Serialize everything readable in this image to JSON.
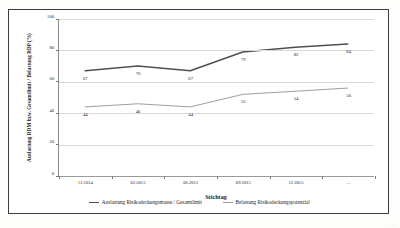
{
  "figure": {
    "scan_artifact": "...."
  },
  "chart_data": {
    "type": "line",
    "title": "",
    "subtitle": "",
    "xlabel": "Stichtag",
    "ylabel": "Auslastung RDM bzw. Gesamtlimit / Belastung RDP (%)",
    "categories": [
      "12.2014",
      "03.2015",
      "06.2015",
      "09.2015",
      "12.2015",
      "..."
    ],
    "ylim": [
      0,
      100
    ],
    "yticks": [
      0,
      20,
      40,
      60,
      80,
      100
    ],
    "ytick_labels": [
      "0",
      "20",
      "40",
      "60",
      "80",
      "100"
    ],
    "grid": true,
    "legend_position": "bottom",
    "series": [
      {
        "name": "Auslastung Risikodeckungsmasse / Gesamtlimit",
        "values": [
          67,
          70,
          67,
          79,
          82,
          84
        ],
        "color": "#4f4f4f",
        "width": 1.5
      },
      {
        "name": "Belastung Risikodeckungspotenzial",
        "values": [
          44,
          46,
          44,
          52,
          54,
          56
        ],
        "color": "#9d9d9d",
        "width": 1.0
      }
    ]
  }
}
